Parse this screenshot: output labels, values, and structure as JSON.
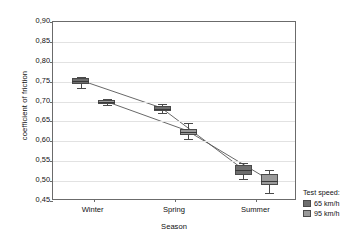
{
  "chart_data": {
    "type": "line",
    "title": "",
    "xlabel": "Season",
    "ylabel": "coefficient of friction",
    "categories": [
      "Winter",
      "Spring",
      "Summer"
    ],
    "ylim": [
      0.45,
      0.9
    ],
    "ytick_labels": [
      "0,90",
      "0,85",
      "0,80",
      "0,75",
      "0,70",
      "0,65",
      "0,60",
      "0,55",
      "0,50",
      "0,45"
    ],
    "ytick_values": [
      0.9,
      0.85,
      0.8,
      0.75,
      0.7,
      0.65,
      0.6,
      0.55,
      0.5,
      0.45
    ],
    "grid": true,
    "legend_position": "right-bottom-outside",
    "decimal_separator": ",",
    "marker_style": "box-with-whiskers",
    "series": [
      {
        "name": "65 km/h",
        "color": "#6e6e6e",
        "values": [
          0.752,
          0.682,
          0.528
        ],
        "boxes": [
          {
            "category": "Winter",
            "low": 0.744,
            "high": 0.76,
            "median": 0.752,
            "whisker_low": 0.733,
            "whisker_high": 0.762
          },
          {
            "category": "Spring",
            "low": 0.676,
            "high": 0.688,
            "median": 0.682,
            "whisker_low": 0.671,
            "whisker_high": 0.694
          },
          {
            "category": "Summer",
            "low": 0.516,
            "high": 0.54,
            "median": 0.528,
            "whisker_low": 0.505,
            "whisker_high": 0.545
          }
        ]
      },
      {
        "name": "95 km/h",
        "color": "#9a9a9a",
        "values": [
          0.698,
          0.624,
          0.501
        ],
        "boxes": [
          {
            "category": "Winter",
            "low": 0.694,
            "high": 0.703,
            "median": 0.698,
            "whisker_low": 0.691,
            "whisker_high": 0.706
          },
          {
            "category": "Spring",
            "low": 0.616,
            "high": 0.632,
            "median": 0.624,
            "whisker_low": 0.607,
            "whisker_high": 0.645
          },
          {
            "category": "Summer",
            "low": 0.49,
            "high": 0.518,
            "median": 0.501,
            "whisker_low": 0.47,
            "whisker_high": 0.528
          }
        ]
      }
    ]
  },
  "legend": {
    "title": "Test speed:",
    "entries": [
      {
        "label": "65 km/h",
        "color": "#6e6e6e"
      },
      {
        "label": "95 km/h",
        "color": "#9a9a9a"
      }
    ]
  }
}
